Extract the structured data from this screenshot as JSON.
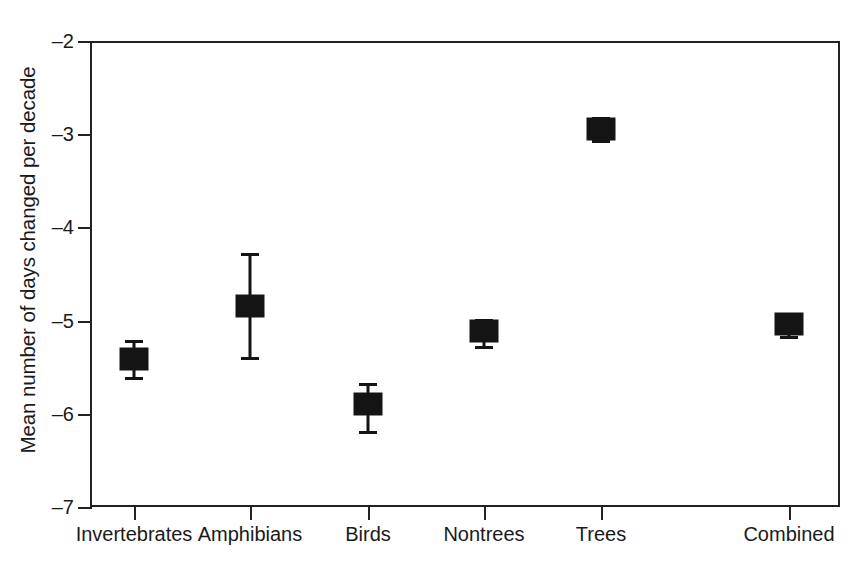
{
  "figure": {
    "background_color": "#ffffff",
    "axis_color": "#222222",
    "marker_color": "#141414"
  },
  "axes": {
    "ylabel": "Mean number of days changed per decade",
    "xlabel": "",
    "ytick_labels": [
      "-2",
      "-3",
      "-4",
      "-5",
      "-6",
      "-7"
    ],
    "ytick_values": [
      -2,
      -3,
      -4,
      -5,
      -6,
      -7
    ],
    "ylim": [
      -7,
      -2
    ],
    "grid": false,
    "frame": "box"
  },
  "chart_data": {
    "type": "scatter",
    "title": "",
    "xlabel": "",
    "ylabel": "Mean number of days changed per decade",
    "ylim": [
      -7,
      -2
    ],
    "grid": false,
    "legend": "none",
    "marker_style": "filled-square-with-error-bars",
    "categories": [
      "Invertebrates",
      "Amphibians",
      "Birds",
      "Nontrees",
      "Trees",
      "Combined"
    ],
    "values": [
      -5.41,
      -4.84,
      -5.9,
      -5.11,
      -2.94,
      -5.04
    ],
    "error_low": [
      -5.61,
      -5.39,
      -6.18,
      -5.27,
      -3.06,
      -5.17
    ],
    "error_high": [
      -5.21,
      -4.27,
      -5.67,
      -4.98,
      -2.82,
      -4.92
    ],
    "points": [
      {
        "category": "Invertebrates",
        "value": -5.41,
        "low": -5.61,
        "high": -5.21
      },
      {
        "category": "Amphibians",
        "value": -4.84,
        "low": -5.39,
        "high": -4.27
      },
      {
        "category": "Birds",
        "value": -5.9,
        "low": -6.18,
        "high": -5.67
      },
      {
        "category": "Nontrees",
        "value": -5.11,
        "low": -5.27,
        "high": -4.98
      },
      {
        "category": "Trees",
        "value": -2.94,
        "low": -3.06,
        "high": -2.82
      },
      {
        "category": "Combined",
        "value": -5.04,
        "low": -5.17,
        "high": -4.92
      }
    ]
  }
}
